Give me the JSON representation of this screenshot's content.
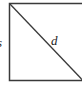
{
  "diagram": {
    "shape": "square",
    "side_label": "s",
    "diagonal_label": "d",
    "stroke_color": "#3a3a3a"
  }
}
